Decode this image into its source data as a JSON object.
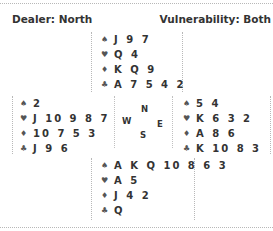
{
  "header": {
    "dealer": "Dealer: North",
    "vulnerability": "Vulnerability: Both"
  },
  "suits": {
    "spades": "♠",
    "hearts": "♥",
    "diamonds": "♦",
    "clubs": "♣"
  },
  "hands": {
    "north": {
      "spades": "J 9 7",
      "hearts": "Q 4",
      "diamonds": "K Q 9",
      "clubs": "A 7 5 4 2"
    },
    "west": {
      "spades": "2",
      "hearts": "J 10 9 8 7",
      "diamonds": "10 7 5 3",
      "clubs": "J 9 6"
    },
    "east": {
      "spades": "5 4",
      "hearts": "K 6 3 2",
      "diamonds": "A 8 6",
      "clubs": "K 10 8 3"
    },
    "south": {
      "spades": "A K Q 10 8 6 3",
      "hearts": "A 5",
      "diamonds": "J 4 2",
      "clubs": "Q"
    }
  },
  "compass": {
    "north": "N",
    "west": "W",
    "east": "E",
    "south": "S"
  }
}
